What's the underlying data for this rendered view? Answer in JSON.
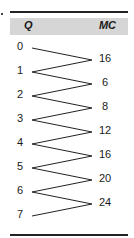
{
  "table": {
    "headers": {
      "q": "Q",
      "mc": "MC"
    },
    "q_values": [
      "0",
      "1",
      "2",
      "3",
      "4",
      "5",
      "6",
      "7"
    ],
    "mc_values": [
      "16",
      "6",
      "8",
      "12",
      "16",
      "20",
      "24"
    ]
  }
}
